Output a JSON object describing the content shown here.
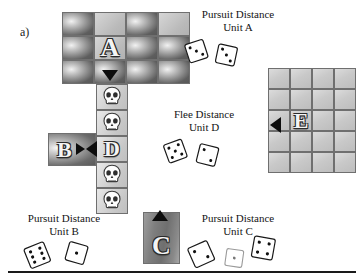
{
  "figure": {
    "panel_label": "a)",
    "background_color": "#ffffff",
    "rule_color": "#1a1a1a"
  },
  "units": {
    "a": {
      "letter": "A",
      "name": "Unit A"
    },
    "b": {
      "letter": "B",
      "name": "Unit B"
    },
    "c": {
      "letter": "C",
      "name": "Unit C"
    },
    "d": {
      "letter": "D",
      "name": "Unit D"
    },
    "e": {
      "letter": "E",
      "name": "Unit E"
    }
  },
  "captions": [
    {
      "id": "pursuit-a",
      "line1": "Pursuit Distance",
      "line2": "Unit A",
      "dice": [
        3,
        3
      ],
      "x": 186,
      "y": 8
    },
    {
      "id": "flee-d",
      "line1": "Flee Distance",
      "line2": "Unit D",
      "dice": [
        5,
        2
      ],
      "x": 152,
      "y": 108
    },
    {
      "id": "pursuit-b",
      "line1": "Pursuit Distance",
      "line2": "Unit B",
      "dice": [
        6,
        1
      ],
      "x": 12,
      "y": 212
    },
    {
      "id": "pursuit-c",
      "line1": "Pursuit Distance",
      "line2": "Unit C",
      "dice": [
        2,
        1,
        4
      ],
      "x": 186,
      "y": 212
    }
  ],
  "grids": {
    "top": {
      "name": "unit-a-grid",
      "cols": 4,
      "rows": 3,
      "x": 62,
      "y": 12,
      "cell_w": 32,
      "cell_h": 24,
      "tiles": [
        [
          "dark",
          "light",
          "dark",
          "light"
        ],
        [
          "dark",
          "dark",
          "dark",
          "dark"
        ],
        [
          "dark",
          "dark",
          "dark",
          "dark"
        ]
      ],
      "letter_cell": {
        "row": 1,
        "col": 1,
        "letter": "A"
      },
      "arrow": {
        "dir": "down",
        "row": 2,
        "col": 1
      }
    },
    "right": {
      "name": "unit-e-grid",
      "cols": 4,
      "rows": 5,
      "x": 268,
      "y": 68,
      "cell_w": 22,
      "cell_h": 21,
      "letter_cell": {
        "row": 2,
        "col": 2,
        "letter": "E"
      },
      "arrow": {
        "dir": "left",
        "row": 2,
        "col": 0
      }
    },
    "corridor": {
      "name": "corridor-path",
      "x": 96,
      "y": 84,
      "cell_w": 32,
      "cell_h": 26,
      "cells": [
        "skull",
        "skull",
        "unit-d",
        "skull",
        "skull"
      ]
    },
    "b_tile": {
      "name": "unit-b-tile",
      "x": 48,
      "y": 133,
      "w": 48,
      "h": 33,
      "letter": "B"
    },
    "c_tile": {
      "name": "unit-c-tile",
      "x": 143,
      "y": 212,
      "w": 37,
      "h": 52,
      "letter": "C"
    }
  },
  "icons": {
    "skull": "skull-icon",
    "die": "die-icon",
    "arrow_down": "arrow-down-icon",
    "arrow_up": "arrow-up-icon",
    "arrow_left": "arrow-left-icon",
    "arrow_right": "arrow-right-icon"
  }
}
